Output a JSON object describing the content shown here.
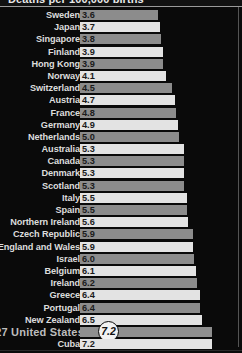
{
  "header": {
    "title": "Deaths per 100,000 births",
    "cropped": true
  },
  "highlight": {
    "rank": "27",
    "country": "United States",
    "label": "27 United States",
    "callout_value": "7.2"
  },
  "colors": {
    "background": "#0a0a0a",
    "bar_light": "#e3e3e3",
    "bar_dark": "#8c8c8c",
    "label_text": "#dcdcdc",
    "value_text": "#1b1b1b",
    "callout_fill": "#f2f2f2",
    "rule": "#9a9a9a"
  },
  "chart_data": {
    "type": "bar",
    "title": "Deaths per 100,000 births",
    "xlabel": "",
    "ylabel": "",
    "orientation": "horizontal",
    "xlim": [
      0,
      7.7
    ],
    "grid": false,
    "legend": null,
    "categories": [
      "Sweden",
      "Japan",
      "Singapore",
      "Finland",
      "Hong Kong",
      "Norway",
      "Switzerland",
      "Austria",
      "France",
      "Germany",
      "Netherlands",
      "Australia",
      "Canada",
      "Denmark",
      "Scotland",
      "Italy",
      "Spain",
      "Northern Ireland",
      "Czech Republic",
      "England and Wales",
      "Israel",
      "Belgium",
      "Ireland",
      "Greece",
      "Portugal",
      "New Zealand",
      "United States",
      "Cuba"
    ],
    "values": [
      3.6,
      3.7,
      3.8,
      3.9,
      3.9,
      4.1,
      4.5,
      4.7,
      4.8,
      4.9,
      5.0,
      5.3,
      5.3,
      5.3,
      5.3,
      5.5,
      5.5,
      5.6,
      5.9,
      5.9,
      6.0,
      6.1,
      6.2,
      6.4,
      6.4,
      6.5,
      7.2,
      7.2
    ],
    "value_labels": [
      "3.6",
      "3.7",
      "3.8",
      "3.9",
      "3.9",
      "4.1",
      "4.5",
      "4.7",
      "4.8",
      "4.9",
      "5.0",
      "5.3",
      "5.3",
      "5.3",
      "5.3",
      "5.5",
      "5.5",
      "5.6",
      "5.9",
      "5.9",
      "6.0",
      "6.1",
      "6.2",
      "6.4",
      "6.4",
      "6.5",
      "7.2",
      "7.2"
    ],
    "highlighted_index": 26,
    "highlighted_label": "27 United States"
  }
}
